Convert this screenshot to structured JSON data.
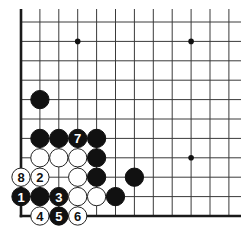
{
  "diagram": {
    "type": "go-board-corner",
    "corner": "bottom-left",
    "grid": {
      "origin_x": 21,
      "origin_y": 22,
      "spacing_x": 18.9,
      "spacing_y": 19.4,
      "cols": 12,
      "rows": 11,
      "line_extend_top": 9,
      "line_extend_right": 241
    },
    "edges": [
      "left",
      "bottom"
    ],
    "hoshi": [
      {
        "col": 3,
        "row": 1
      },
      {
        "col": 9,
        "row": 1
      },
      {
        "col": 9,
        "row": 7
      }
    ],
    "stones": [
      {
        "color": "black",
        "col": 1,
        "row": 4,
        "label": ""
      },
      {
        "color": "black",
        "col": 1,
        "row": 6,
        "label": ""
      },
      {
        "color": "black",
        "col": 2,
        "row": 6,
        "label": ""
      },
      {
        "color": "black",
        "col": 3,
        "row": 6,
        "label": "7"
      },
      {
        "color": "black",
        "col": 4,
        "row": 6,
        "label": ""
      },
      {
        "color": "white",
        "col": 1,
        "row": 7,
        "label": ""
      },
      {
        "color": "white",
        "col": 2,
        "row": 7,
        "label": ""
      },
      {
        "color": "white",
        "col": 3,
        "row": 7,
        "label": ""
      },
      {
        "color": "black",
        "col": 4,
        "row": 7,
        "label": ""
      },
      {
        "color": "white",
        "col": 0,
        "row": 8,
        "label": "8"
      },
      {
        "color": "white",
        "col": 1,
        "row": 8,
        "label": "2"
      },
      {
        "color": "white",
        "col": 3,
        "row": 8,
        "label": ""
      },
      {
        "color": "black",
        "col": 4,
        "row": 8,
        "label": ""
      },
      {
        "color": "black",
        "col": 6,
        "row": 8,
        "label": ""
      },
      {
        "color": "black",
        "col": 0,
        "row": 9,
        "label": "1"
      },
      {
        "color": "black",
        "col": 1,
        "row": 9,
        "label": ""
      },
      {
        "color": "black",
        "col": 2,
        "row": 9,
        "label": "3"
      },
      {
        "color": "white",
        "col": 3,
        "row": 9,
        "label": ""
      },
      {
        "color": "white",
        "col": 4,
        "row": 9,
        "label": ""
      },
      {
        "color": "black",
        "col": 5,
        "row": 9,
        "label": ""
      },
      {
        "color": "white",
        "col": 1,
        "row": 10,
        "label": "4"
      },
      {
        "color": "black",
        "col": 2,
        "row": 10,
        "label": "5"
      },
      {
        "color": "white",
        "col": 3,
        "row": 10,
        "label": "6"
      }
    ],
    "colors": {
      "black_stone": "#111111",
      "white_stone": "#ffffff",
      "line": "#3a3a3a",
      "background": "#ffffff"
    }
  }
}
